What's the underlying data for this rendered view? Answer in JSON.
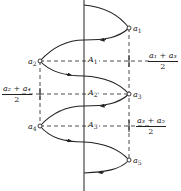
{
  "diagram": {
    "type": "oscillation-trajectory",
    "stroke_color": "#222222",
    "background": "#ffffff",
    "points": [
      {
        "id": "a1",
        "label": "a",
        "sub": "1",
        "x": 129,
        "y": 28
      },
      {
        "id": "a2",
        "label": "a",
        "sub": "2",
        "x": 40,
        "y": 61
      },
      {
        "id": "a3",
        "label": "a",
        "sub": "3",
        "x": 129,
        "y": 94
      },
      {
        "id": "a4",
        "label": "a",
        "sub": "4",
        "x": 40,
        "y": 126
      },
      {
        "id": "a5",
        "label": "a",
        "sub": "5",
        "x": 129,
        "y": 160
      }
    ],
    "levels": [
      {
        "id": "A1",
        "label": "A",
        "sub": "1",
        "y": 61
      },
      {
        "id": "A2",
        "label": "A",
        "sub": "2'",
        "y": 94
      },
      {
        "id": "A3",
        "label": "A",
        "sub": "3",
        "y": 126
      }
    ],
    "midpoints": [
      {
        "numerator": "a₁ + a₃",
        "denominator": "2",
        "x": 129,
        "y": 61,
        "side": "right"
      },
      {
        "numerator": "a₂ + a₄",
        "denominator": "2",
        "x": 40,
        "y": 94,
        "side": "left"
      },
      {
        "numerator": "a₃ + a₅",
        "denominator": "2",
        "x": 129,
        "y": 126,
        "side": "right"
      }
    ]
  },
  "labels": {
    "a1": {
      "main": "a",
      "sub": "1"
    },
    "a2": {
      "main": "a",
      "sub": "2"
    },
    "a3": {
      "main": "a",
      "sub": "3"
    },
    "a4": {
      "main": "a",
      "sub": "4"
    },
    "a5": {
      "main": "a",
      "sub": "5"
    },
    "A1": {
      "main": "A",
      "sub": "1"
    },
    "A2": {
      "main": "A",
      "sub": "2'"
    },
    "A3": {
      "main": "A",
      "sub": "3"
    },
    "m13": {
      "num": "a₁ + a₃",
      "den": "2"
    },
    "m24": {
      "num": "a₂ + a₄",
      "den": "2"
    },
    "m35": {
      "num": "a₃ + a₅",
      "den": "2"
    }
  }
}
